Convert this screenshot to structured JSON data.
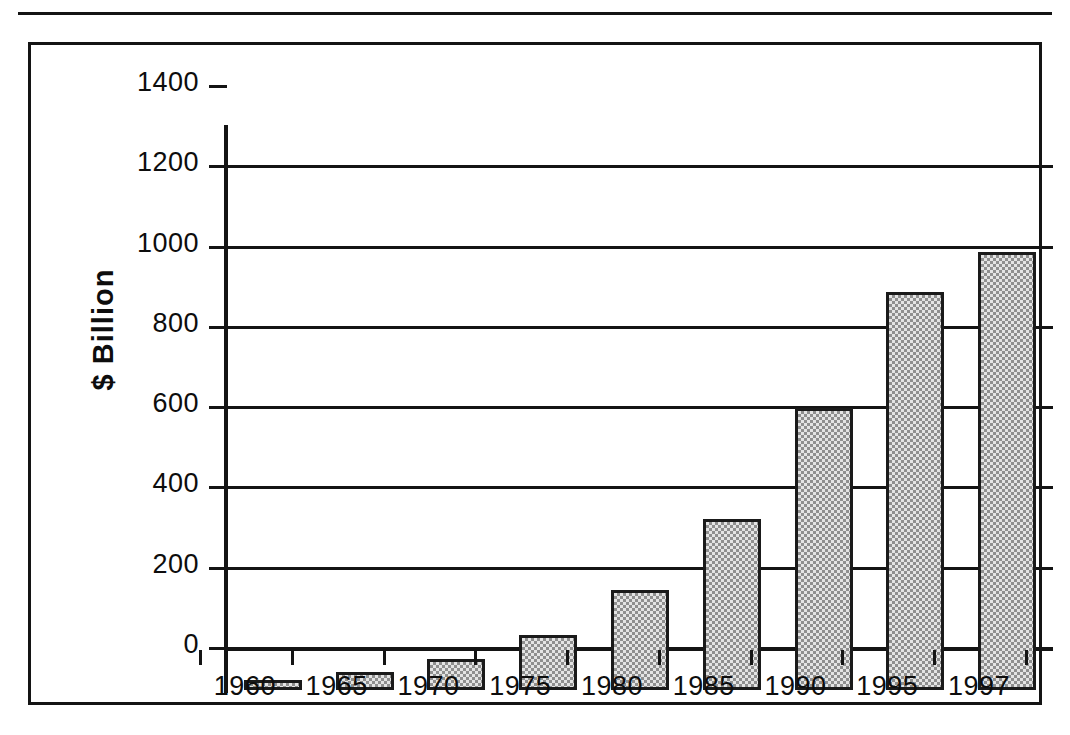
{
  "figure": {
    "has_top_rule": true,
    "frame_color": "#141414",
    "background_color": "#ffffff",
    "bar_fill_color": "#b9b9b9",
    "bar_edge_color": "#1a1a1a"
  },
  "chart_data": {
    "type": "bar",
    "title": "",
    "subtitle": "",
    "xlabel": "",
    "ylabel": "$ Billion",
    "categories": [
      "1960",
      "1965",
      "1970",
      "1975",
      "1980",
      "1985",
      "1990",
      "1995",
      "1997"
    ],
    "values": [
      25,
      45,
      78,
      137,
      248,
      426,
      703,
      991,
      1092
    ],
    "ylim": [
      0,
      1400
    ],
    "ytick_values": [
      0,
      200,
      400,
      600,
      800,
      1000,
      1200,
      1400
    ],
    "ytick_labels": [
      "0",
      "200",
      "400",
      "600",
      "800",
      "1000",
      "1200",
      "1400"
    ],
    "grid": true,
    "grid_axis": "y",
    "legend": null,
    "legend_position": "none",
    "annotations": []
  }
}
